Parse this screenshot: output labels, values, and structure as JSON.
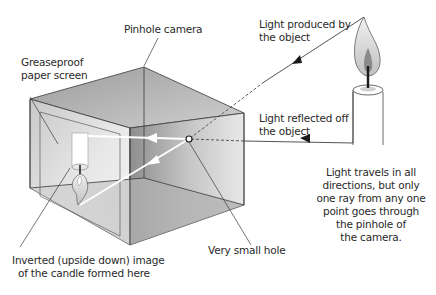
{
  "labels": {
    "pinhole_camera": "Pinhole camera",
    "greaseproof_line1": "Greaseproof",
    "greaseproof_line2": "paper screen",
    "light_produced_line1": "Light produced by",
    "light_produced_line2": "the object",
    "light_reflected_line1": "Light reflected off",
    "light_reflected_line2": "the object",
    "inverted_line1": "Inverted (upside down) image",
    "inverted_line2": "of the candle formed here",
    "small_hole": "Very small hole",
    "explanation_line1": "Light travels in all",
    "explanation_line2": "directions, but only",
    "explanation_line3": "one ray from any one",
    "explanation_line4": "point goes through",
    "explanation_line5": "the pinhole of",
    "explanation_line6": "the camera."
  },
  "colors": {
    "outline": "#3a3a3a",
    "box_light": "#f2f2f2",
    "box_mid": "#d6d6d6",
    "box_dark": "#a8a8a8",
    "ray_white": "#ffffff"
  }
}
